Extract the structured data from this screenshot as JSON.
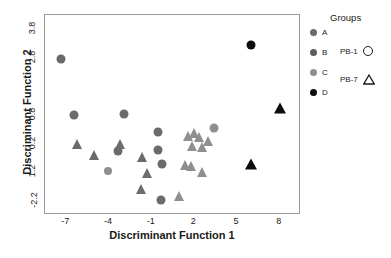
{
  "chart_data": {
    "type": "scatter",
    "title": "",
    "xlabel": "Discriminant Function 1",
    "ylabel": "Discriminant Function 2",
    "xlim": [
      -8.5,
      9.5
    ],
    "ylim": [
      -2.7,
      4.3
    ],
    "xticks": [
      "-7",
      "-4",
      "-1",
      "2",
      "5",
      "8"
    ],
    "xtick_values": [
      -7,
      -4,
      -1,
      2,
      5,
      8
    ],
    "yticks": [
      "3.8",
      "2.8",
      "0.8",
      "0.2",
      "1.2",
      "-2.2"
    ],
    "ytick_values": [
      3.8,
      2.8,
      0.8,
      -0.2,
      -1.2,
      -2.2
    ],
    "grid": false,
    "legend_position": "right",
    "legend_title": "Groups",
    "groups": [
      {
        "label": "A",
        "color": "#6b6b6b"
      },
      {
        "label": "B",
        "color": "#5e5e5e"
      },
      {
        "label": "C",
        "color": "#8f8f8f"
      },
      {
        "label": "D",
        "color": "#0d0d0d"
      }
    ],
    "shape_legend": [
      {
        "label": "PB-1",
        "shape": "circle"
      },
      {
        "label": "PB-7",
        "shape": "triangle"
      }
    ],
    "points": [
      {
        "x": -7.35,
        "y": 2.77,
        "shape": "circle",
        "color": "#6b6b6b",
        "size": 9
      },
      {
        "x": -6.45,
        "y": 0.79,
        "shape": "circle",
        "color": "#6b6b6b",
        "size": 9
      },
      {
        "x": -2.95,
        "y": 0.82,
        "shape": "circle",
        "color": "#6b6b6b",
        "size": 9
      },
      {
        "x": -6.25,
        "y": -0.22,
        "shape": "triangle",
        "color": "#6b6b6b",
        "size": 10
      },
      {
        "x": -5.05,
        "y": -0.6,
        "shape": "triangle",
        "color": "#6b6b6b",
        "size": 10
      },
      {
        "x": -3.25,
        "y": -0.22,
        "shape": "triangle",
        "color": "#6b6b6b",
        "size": 10
      },
      {
        "x": -3.35,
        "y": -0.46,
        "shape": "circle",
        "color": "#6b6b6b",
        "size": 9
      },
      {
        "x": -4.1,
        "y": -1.15,
        "shape": "circle",
        "color": "#8f8f8f",
        "size": 8
      },
      {
        "x": -1.65,
        "y": -0.68,
        "shape": "triangle",
        "color": "#6b6b6b",
        "size": 10
      },
      {
        "x": -1.35,
        "y": -1.22,
        "shape": "triangle",
        "color": "#6b6b6b",
        "size": 10
      },
      {
        "x": -1.75,
        "y": -1.78,
        "shape": "triangle",
        "color": "#6b6b6b",
        "size": 10
      },
      {
        "x": -0.55,
        "y": -0.42,
        "shape": "circle",
        "color": "#6b6b6b",
        "size": 9
      },
      {
        "x": -0.25,
        "y": -0.92,
        "shape": "circle",
        "color": "#6b6b6b",
        "size": 9
      },
      {
        "x": -0.55,
        "y": 0.2,
        "shape": "circle",
        "color": "#6b6b6b",
        "size": 9
      },
      {
        "x": -0.35,
        "y": -2.18,
        "shape": "circle",
        "color": "#6b6b6b",
        "size": 9
      },
      {
        "x": 0.95,
        "y": -2.02,
        "shape": "triangle",
        "color": "#8f8f8f",
        "size": 10
      },
      {
        "x": 1.55,
        "y": 0.05,
        "shape": "triangle",
        "color": "#8f8f8f",
        "size": 10
      },
      {
        "x": 1.95,
        "y": 0.18,
        "shape": "triangle",
        "color": "#8f8f8f",
        "size": 10
      },
      {
        "x": 2.35,
        "y": 0.02,
        "shape": "triangle",
        "color": "#8f8f8f",
        "size": 10
      },
      {
        "x": 1.85,
        "y": -0.3,
        "shape": "triangle",
        "color": "#8f8f8f",
        "size": 10
      },
      {
        "x": 2.55,
        "y": -0.32,
        "shape": "triangle",
        "color": "#8f8f8f",
        "size": 10
      },
      {
        "x": 2.95,
        "y": -0.12,
        "shape": "triangle",
        "color": "#8f8f8f",
        "size": 10
      },
      {
        "x": 3.35,
        "y": 0.35,
        "shape": "circle",
        "color": "#8f8f8f",
        "size": 9
      },
      {
        "x": 1.35,
        "y": -0.95,
        "shape": "triangle",
        "color": "#8f8f8f",
        "size": 10
      },
      {
        "x": 1.75,
        "y": -0.98,
        "shape": "triangle",
        "color": "#8f8f8f",
        "size": 10
      },
      {
        "x": 2.55,
        "y": -1.18,
        "shape": "triangle",
        "color": "#8f8f8f",
        "size": 10
      },
      {
        "x": 5.95,
        "y": 3.25,
        "shape": "circle",
        "color": "#0d0d0d",
        "size": 9
      },
      {
        "x": 8.0,
        "y": 1.05,
        "shape": "triangle",
        "color": "#0d0d0d",
        "size": 11
      },
      {
        "x": 6.0,
        "y": -0.92,
        "shape": "triangle",
        "color": "#0d0d0d",
        "size": 11
      }
    ]
  }
}
